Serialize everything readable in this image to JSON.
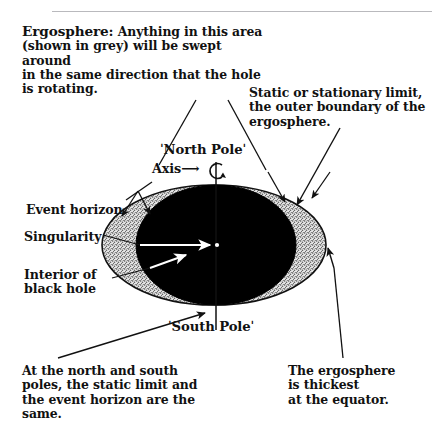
{
  "figure": {
    "colors": {
      "ink": "#111111",
      "ergosphere_fill": "#d4d4d4",
      "event_horizon_fill": "#000000",
      "page_background": "#ffffff",
      "header_rule": "#b9b9bd"
    }
  },
  "notes": {
    "ergosphere": {
      "lead": "Ergosphere:",
      "body": " Anything in this area\n(shown in grey) will be swept around\nin the same direction that the hole\nis rotating."
    },
    "static_limit": "Static or stationary limit,\nthe outer boundary of the\nergosphere.",
    "poles_same": "At the north and south\npoles, the static limit and\nthe event horizon are the\nsame.",
    "equator_thickest": "The ergosphere\nis thickest\n at the equator."
  },
  "labels": {
    "north_pole": "ˈNorth Poleˈ",
    "south_pole": "ˈSouth Poleˈ",
    "axis": "Axis",
    "axis_arrow": "⟶",
    "event_horizon": "Event horizon",
    "singularity": "Singularity",
    "interior": "Interior of\nblack hole"
  },
  "geometry": {
    "ergosphere_ellipse": {
      "cx": 214,
      "cy": 245,
      "rx": 112,
      "ry": 60
    },
    "event_horizon_ellipse": {
      "cx": 216,
      "cy": 245,
      "rx": 80,
      "ry": 60
    },
    "singularity_point": {
      "cx": 216,
      "cy": 245,
      "r": 2
    },
    "axis_line": {
      "x": 216,
      "y_top": 160,
      "y_bottom": 330
    }
  }
}
